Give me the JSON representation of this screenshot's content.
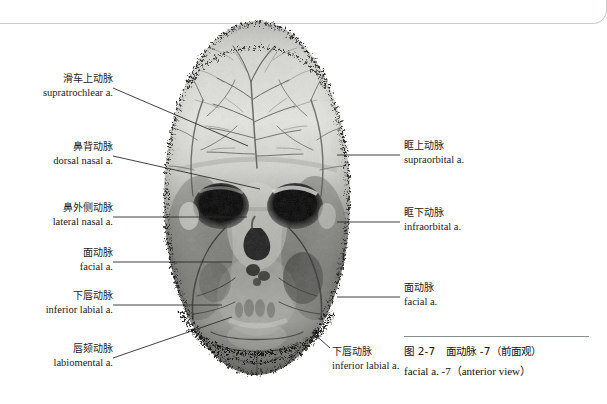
{
  "page": {
    "background_color": "#ffffff",
    "rule_color": "#c9cbcd"
  },
  "figure": {
    "specimen_name": "vascular-cast-skull-anterior",
    "tone_dark": "#1c1c1c",
    "tone_mid": "#8e8e8e",
    "tone_light": "#e8e8e6"
  },
  "labels_left": [
    {
      "id": "supratrochlear",
      "cn": "滑车上动脉",
      "en": "supratrochlear a."
    },
    {
      "id": "dorsal-nasal",
      "cn": "鼻背动脉",
      "en": "dorsal nasal a."
    },
    {
      "id": "lateral-nasal",
      "cn": "鼻外侧动脉",
      "en": "lateral nasal a."
    },
    {
      "id": "facial-left",
      "cn": "面动脉",
      "en": "facial a."
    },
    {
      "id": "inferior-labial-left",
      "cn": "下唇动脉",
      "en": "inferior labial a."
    },
    {
      "id": "labiomental",
      "cn": "唇颏动脉",
      "en": "labiomental a."
    }
  ],
  "labels_right": [
    {
      "id": "supraorbital",
      "cn": "眶上动脉",
      "en": "supraorbital a."
    },
    {
      "id": "infraorbital",
      "cn": "眶下动脉",
      "en": "infraorbital a."
    },
    {
      "id": "facial-right",
      "cn": "面动脉",
      "en": "facial a."
    }
  ],
  "labels_bottom": [
    {
      "id": "inferior-labial-bottom",
      "cn": "下唇动脉",
      "en": "inferior labial a."
    }
  ],
  "caption": {
    "cn": "图 2-7　面动脉 -7（前面观）",
    "en": "facial a. -7（anterior view）"
  }
}
